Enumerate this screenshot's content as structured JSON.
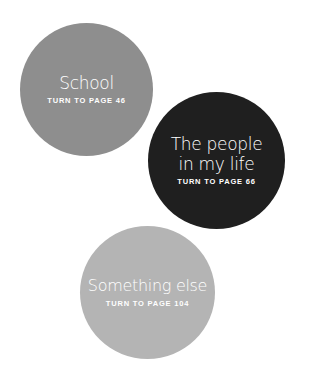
{
  "options": [
    {
      "title": "School",
      "subtitle": "TURN TO PAGE 46",
      "color": "#8e8e8e"
    },
    {
      "title_line1": "The people",
      "title_line2": "in my life",
      "subtitle": "TURN TO PAGE 66",
      "color": "#1f1f1f"
    },
    {
      "title": "Something else",
      "subtitle": "TURN TO PAGE 104",
      "color": "#b4b4b4"
    }
  ]
}
